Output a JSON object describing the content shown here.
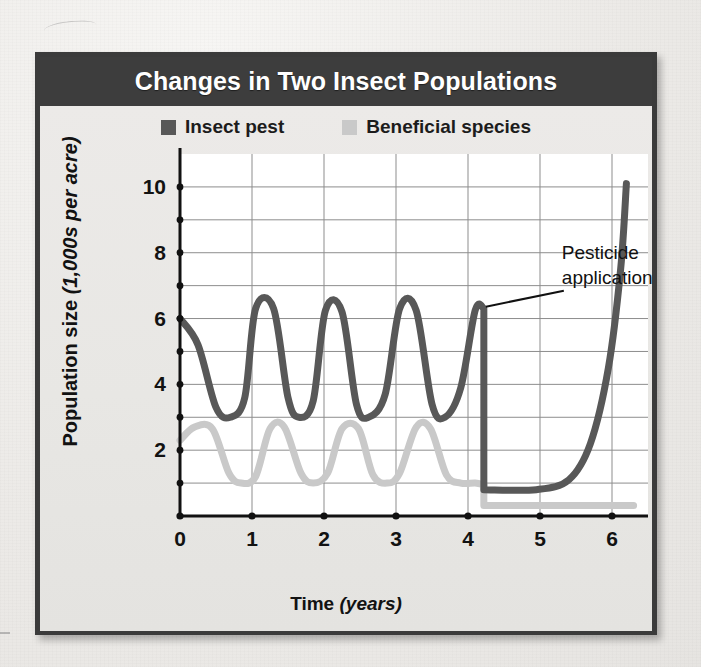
{
  "figure": {
    "title": "Changes in Two Insect Populations",
    "frame_color": "#3d3d3d",
    "panel_background": "#e9e8e6",
    "plot_background": "#ffffff"
  },
  "legend": {
    "position": "top-center",
    "items": [
      {
        "label": "Insect pest",
        "color": "#585858",
        "swatch": "legend-swatch-pest"
      },
      {
        "label": "Beneficial species",
        "color": "#c9c9c9",
        "swatch": "legend-swatch-beneficial"
      }
    ]
  },
  "axes": {
    "y": {
      "title_main": "Population size",
      "title_unit": "(1,000s per acre)",
      "tick_labels": [
        "2",
        "4",
        "6",
        "8",
        "10"
      ],
      "major_ticks": [
        2,
        4,
        6,
        8,
        10
      ],
      "minor_ticks": [
        1,
        3,
        5,
        7,
        9
      ],
      "range": [
        0,
        11
      ]
    },
    "x": {
      "title_main": "Time",
      "title_unit": "(years)",
      "tick_labels": [
        "0",
        "1",
        "2",
        "3",
        "4",
        "5",
        "6"
      ],
      "major_ticks": [
        0,
        1,
        2,
        3,
        4,
        5,
        6
      ],
      "range": [
        0,
        6.5
      ]
    }
  },
  "annotations": [
    {
      "text_line1": "Pesticide",
      "text_line2": "application",
      "points_to_x": 4.22,
      "points_to_y": 6.3
    }
  ],
  "chart_data": {
    "type": "line",
    "title": "Changes in Two Insect Populations",
    "xlabel": "Time (years)",
    "ylabel": "Population size (1,000s per acre)",
    "xlim": [
      0,
      6.5
    ],
    "ylim": [
      0,
      11
    ],
    "grid": true,
    "legend_position": "top-center",
    "event": {
      "name": "Pesticide application",
      "x": 4.22,
      "description": "Both populations crash; pest rebounds exponentially, beneficial species stays suppressed"
    },
    "series": [
      {
        "name": "Insect pest",
        "color": "#585858",
        "oscillation": {
          "x_start": 0,
          "x_end": 4.22,
          "peak": 6.3,
          "trough": 3.0,
          "period": 1.0,
          "phase_at_x0": "peak"
        },
        "post_event": {
          "crash_to": 0.8,
          "flat_until_x": 4.95,
          "rebound_to": 10.1,
          "rebound_end_x": 6.2,
          "shape": "exponential"
        },
        "points": [
          {
            "x": 0.0,
            "y": 6.0
          },
          {
            "x": 0.25,
            "y": 5.2
          },
          {
            "x": 0.5,
            "y": 3.3
          },
          {
            "x": 0.7,
            "y": 3.0
          },
          {
            "x": 0.9,
            "y": 3.6
          },
          {
            "x": 1.05,
            "y": 6.3
          },
          {
            "x": 1.3,
            "y": 6.3
          },
          {
            "x": 1.5,
            "y": 3.6
          },
          {
            "x": 1.65,
            "y": 3.0
          },
          {
            "x": 1.85,
            "y": 3.5
          },
          {
            "x": 2.02,
            "y": 6.25
          },
          {
            "x": 2.25,
            "y": 6.2
          },
          {
            "x": 2.45,
            "y": 3.4
          },
          {
            "x": 2.62,
            "y": 3.0
          },
          {
            "x": 2.85,
            "y": 3.7
          },
          {
            "x": 3.05,
            "y": 6.3
          },
          {
            "x": 3.28,
            "y": 6.25
          },
          {
            "x": 3.5,
            "y": 3.4
          },
          {
            "x": 3.68,
            "y": 3.0
          },
          {
            "x": 3.9,
            "y": 3.9
          },
          {
            "x": 4.1,
            "y": 6.25
          },
          {
            "x": 4.22,
            "y": 6.3
          },
          {
            "x": 4.22,
            "y": 0.8
          },
          {
            "x": 4.95,
            "y": 0.8
          },
          {
            "x": 5.4,
            "y": 1.1
          },
          {
            "x": 5.7,
            "y": 2.2
          },
          {
            "x": 5.95,
            "y": 4.5
          },
          {
            "x": 6.12,
            "y": 7.5
          },
          {
            "x": 6.2,
            "y": 10.1
          }
        ]
      },
      {
        "name": "Beneficial species",
        "color": "#c9c9c9",
        "oscillation": {
          "x_start": 0,
          "x_end": 4.22,
          "peak": 2.7,
          "trough": 1.0,
          "period": 1.0,
          "phase_at_x0": "rising"
        },
        "post_event": {
          "crash_to": 0.32,
          "flat_until_x": 6.3,
          "shape": "flat"
        },
        "points": [
          {
            "x": 0.0,
            "y": 2.3
          },
          {
            "x": 0.2,
            "y": 2.7
          },
          {
            "x": 0.45,
            "y": 2.65
          },
          {
            "x": 0.68,
            "y": 1.3
          },
          {
            "x": 0.85,
            "y": 1.0
          },
          {
            "x": 1.05,
            "y": 1.2
          },
          {
            "x": 1.25,
            "y": 2.65
          },
          {
            "x": 1.45,
            "y": 2.7
          },
          {
            "x": 1.68,
            "y": 1.3
          },
          {
            "x": 1.85,
            "y": 1.0
          },
          {
            "x": 2.05,
            "y": 1.3
          },
          {
            "x": 2.25,
            "y": 2.65
          },
          {
            "x": 2.48,
            "y": 2.65
          },
          {
            "x": 2.68,
            "y": 1.25
          },
          {
            "x": 2.88,
            "y": 1.0
          },
          {
            "x": 3.05,
            "y": 1.3
          },
          {
            "x": 3.28,
            "y": 2.7
          },
          {
            "x": 3.48,
            "y": 2.65
          },
          {
            "x": 3.7,
            "y": 1.25
          },
          {
            "x": 3.9,
            "y": 1.0
          },
          {
            "x": 4.1,
            "y": 1.0
          },
          {
            "x": 4.22,
            "y": 0.95
          },
          {
            "x": 4.22,
            "y": 0.32
          },
          {
            "x": 6.3,
            "y": 0.32
          }
        ]
      }
    ]
  }
}
